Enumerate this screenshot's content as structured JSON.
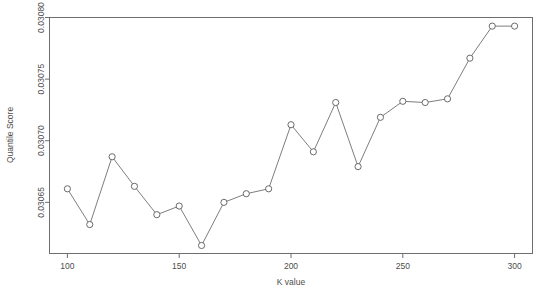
{
  "chart_data": {
    "type": "line",
    "title": "",
    "subtitle": "",
    "xlabel": "K value",
    "ylabel": "Quantile Score",
    "x": [
      100,
      110,
      120,
      130,
      140,
      150,
      160,
      170,
      180,
      190,
      200,
      210,
      220,
      230,
      240,
      250,
      260,
      270,
      280,
      290,
      300
    ],
    "values": [
      0.030661,
      0.030632,
      0.030687,
      0.030663,
      0.03064,
      0.030647,
      0.030615,
      0.03065,
      0.030657,
      0.030661,
      0.030713,
      0.030691,
      0.030731,
      0.030679,
      0.030719,
      0.030732,
      0.030731,
      0.030734,
      0.030767,
      0.030793,
      0.030793
    ],
    "series": [
      {
        "name": "Quantile Score",
        "values": [
          0.030661,
          0.030632,
          0.030687,
          0.030663,
          0.03064,
          0.030647,
          0.030615,
          0.03065,
          0.030657,
          0.030661,
          0.030713,
          0.030691,
          0.030731,
          0.030679,
          0.030719,
          0.030732,
          0.030731,
          0.030734,
          0.030767,
          0.030793,
          0.030793
        ]
      }
    ],
    "xlim": [
      92,
      308
    ],
    "ylim": [
      0.0306085,
      0.0308
    ],
    "xticks": [
      100,
      150,
      200,
      250,
      300
    ],
    "xtick_labels": [
      "100",
      "150",
      "200",
      "250",
      "300"
    ],
    "yticks": [
      0.03065,
      0.0307,
      0.03075,
      0.0308
    ],
    "ytick_labels": [
      "0.03065",
      "0.03070",
      "0.03075",
      "0.03080"
    ],
    "grid": false,
    "legend": false,
    "legend_position": "none",
    "marker": "circle-open",
    "line_color": "#6e6e6e",
    "marker_color": "#5a5a5a",
    "background_color": "#ffffff"
  },
  "axes": {
    "x_title": "K value",
    "y_title": "Quantile Score"
  }
}
